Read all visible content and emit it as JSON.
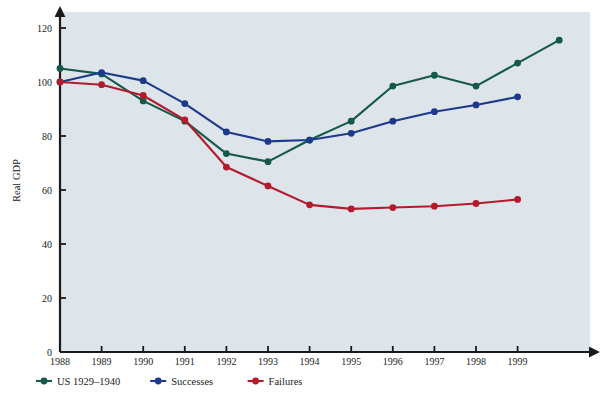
{
  "figure": {
    "background_color": "#dde4ea",
    "axis_color": "#1a1a1a"
  },
  "chart_data": {
    "type": "line",
    "title": "",
    "xlabel": "",
    "ylabel": "Real GDP",
    "x": [
      1988,
      1989,
      1990,
      1991,
      1992,
      1993,
      1994,
      1995,
      1996,
      1997,
      1998,
      1999,
      2000
    ],
    "xticklabels": [
      "1988",
      "1989",
      "1990",
      "1991",
      "1992",
      "1993",
      "1994",
      "1995",
      "1996",
      "1997",
      "1998",
      "1999"
    ],
    "yticklabels": [
      "0",
      "20",
      "40",
      "60",
      "80",
      "100",
      "120"
    ],
    "yticks": [
      0,
      20,
      40,
      60,
      80,
      100,
      120
    ],
    "xlim": [
      1988,
      2000.6
    ],
    "ylim": [
      0,
      127
    ],
    "grid": false,
    "legend_position": "bottom",
    "series": [
      {
        "name": "US 1929–1940",
        "color": "#15594a",
        "x": [
          1988,
          1989,
          1990,
          1991,
          1992,
          1993,
          1994,
          1995,
          1996,
          1997,
          1998,
          1999,
          2000
        ],
        "values": [
          105,
          103,
          93,
          85.5,
          73.5,
          70.5,
          78.5,
          85.5,
          98.5,
          102.5,
          98.5,
          107,
          115.5
        ]
      },
      {
        "name": "Successes",
        "color": "#1b3a8c",
        "x": [
          1988,
          1989,
          1990,
          1991,
          1992,
          1993,
          1994,
          1995,
          1996,
          1997,
          1998,
          1999
        ],
        "values": [
          100,
          103.5,
          100.5,
          92,
          81.5,
          78,
          78.5,
          81,
          85.5,
          89,
          91.5,
          94.5
        ]
      },
      {
        "name": "Failures",
        "color": "#b31b2c",
        "x": [
          1988,
          1989,
          1990,
          1991,
          1992,
          1993,
          1994,
          1995,
          1996,
          1997,
          1998,
          1999
        ],
        "values": [
          100,
          99,
          95,
          86,
          68.5,
          61.5,
          54.5,
          53,
          53.5,
          54,
          55,
          56.5
        ]
      }
    ]
  },
  "legend": {
    "items": [
      {
        "label": "US 1929–1940",
        "color": "#15594a"
      },
      {
        "label": "Successes",
        "color": "#1b3a8c"
      },
      {
        "label": "Failures",
        "color": "#b31b2c"
      }
    ]
  }
}
